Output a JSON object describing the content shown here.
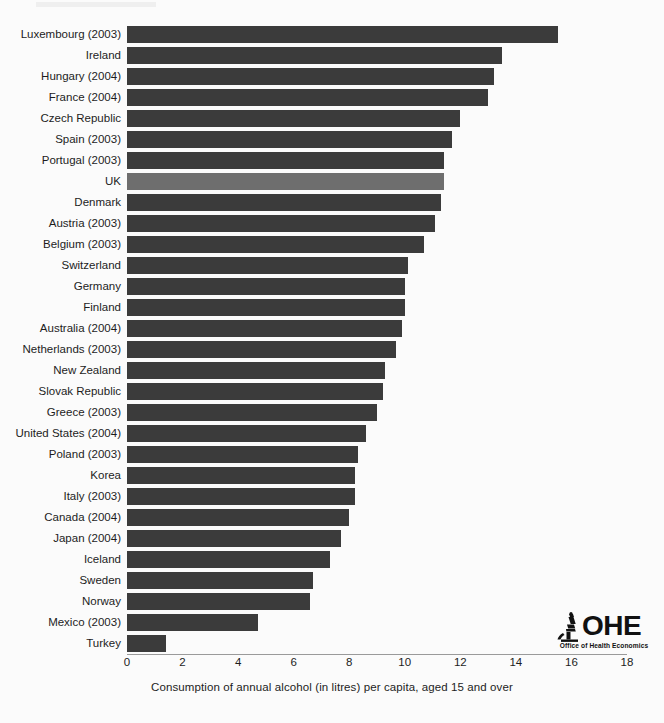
{
  "chart_data": {
    "type": "bar",
    "orientation": "horizontal",
    "title": "",
    "xlabel": "Consumption of annual alcohol (in litres) per capita,  aged 15 and over",
    "ylabel": "",
    "xlim": [
      0,
      18
    ],
    "xticks": [
      "0",
      "2",
      "4",
      "6",
      "8",
      "10",
      "12",
      "14",
      "16",
      "18"
    ],
    "grid": false,
    "legend": "none",
    "bar_color": "#3b3b3b",
    "highlight_color": "#6e6e6e",
    "highlight_category": "UK",
    "categories": [
      "Luxembourg (2003)",
      "Ireland",
      "Hungary (2004)",
      "France (2004)",
      "Czech Republic",
      "Spain (2003)",
      "Portugal (2003)",
      "UK",
      "Denmark",
      "Austria (2003)",
      "Belgium (2003)",
      "Switzerland",
      "Germany",
      "Finland",
      "Australia (2004)",
      "Netherlands (2003)",
      "New Zealand",
      "Slovak Republic",
      "Greece (2003)",
      "United States (2004)",
      "Poland (2003)",
      "Korea",
      "Italy (2003)",
      "Canada (2004)",
      "Japan (2004)",
      "Iceland",
      "Sweden",
      "Norway",
      "Mexico (2003)",
      "Turkey"
    ],
    "values": [
      15.5,
      13.5,
      13.2,
      13.0,
      12.0,
      11.7,
      11.4,
      11.4,
      11.3,
      11.1,
      10.7,
      10.1,
      10.0,
      10.0,
      9.9,
      9.7,
      9.3,
      9.2,
      9.0,
      8.6,
      8.3,
      8.2,
      8.2,
      8.0,
      7.7,
      7.3,
      6.7,
      6.6,
      4.7,
      1.4
    ]
  },
  "logo": {
    "wordmark": "OHE",
    "subtitle": "Office of Health Economics",
    "icon_name": "microscope-icon"
  }
}
